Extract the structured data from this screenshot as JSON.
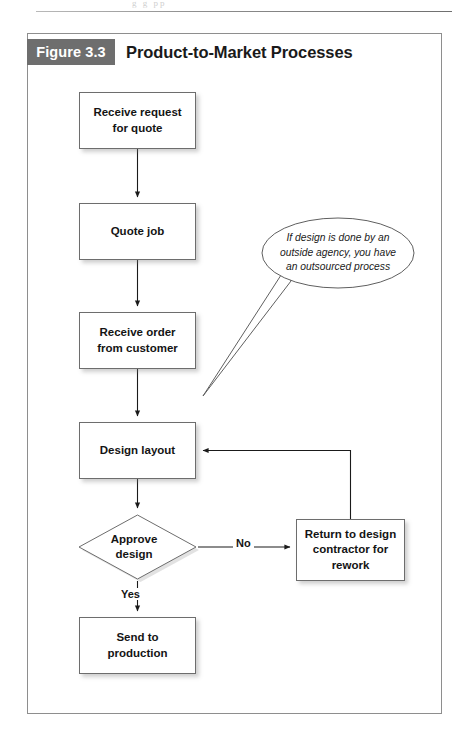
{
  "page": {
    "header_remnant": "g  g  pp"
  },
  "figure": {
    "label": "Figure 3.3",
    "title": "Product-to-Market Processes"
  },
  "flowchart": {
    "nodes": [
      {
        "id": "receive-request",
        "type": "process",
        "text": "Receive request\nfor quote"
      },
      {
        "id": "quote-job",
        "type": "process",
        "text": "Quote job"
      },
      {
        "id": "receive-order",
        "type": "process",
        "text": "Receive order\nfrom customer"
      },
      {
        "id": "design-layout",
        "type": "process",
        "text": "Design layout"
      },
      {
        "id": "approve-design",
        "type": "decision",
        "text": "Approve\ndesign"
      },
      {
        "id": "return-design",
        "type": "process",
        "text": "Return to design\ncontractor for\nrework"
      },
      {
        "id": "send-production",
        "type": "process",
        "text": "Send to\nproduction"
      }
    ],
    "node_text": {
      "receive_request_line1": "Receive request",
      "receive_request_line2": "for quote",
      "quote_job": "Quote job",
      "receive_order_line1": "Receive order",
      "receive_order_line2": "from customer",
      "design_layout": "Design layout",
      "approve_design_line1": "Approve",
      "approve_design_line2": "design",
      "return_design_line1": "Return to design",
      "return_design_line2": "contractor for",
      "return_design_line3": "rework",
      "send_production_line1": "Send to",
      "send_production_line2": "production"
    },
    "edges": [
      {
        "from": "receive-request",
        "to": "quote-job",
        "label": ""
      },
      {
        "from": "quote-job",
        "to": "receive-order",
        "label": ""
      },
      {
        "from": "receive-order",
        "to": "design-layout",
        "label": ""
      },
      {
        "from": "design-layout",
        "to": "approve-design",
        "label": ""
      },
      {
        "from": "approve-design",
        "to": "return-design",
        "label": "No"
      },
      {
        "from": "approve-design",
        "to": "send-production",
        "label": "Yes"
      },
      {
        "from": "return-design",
        "to": "design-layout",
        "label": ""
      }
    ],
    "edge_labels": {
      "no": "No",
      "yes": "Yes"
    },
    "callout": {
      "id": "outsourced-note",
      "text": "If design is done by an outside agency, you have an outsourced process",
      "line1": "If design is done by an",
      "line2": "outside agency, you have",
      "line3": "an outsourced process",
      "points_to": "design-layout"
    }
  },
  "colors": {
    "label_background": "#6e6e6e",
    "label_text": "#ffffff",
    "frame_border": "#8e8e8e",
    "node_border": "#6d6d6d",
    "node_background": "#ffffff",
    "connector": "#1a1a1a",
    "text": "#141414"
  }
}
